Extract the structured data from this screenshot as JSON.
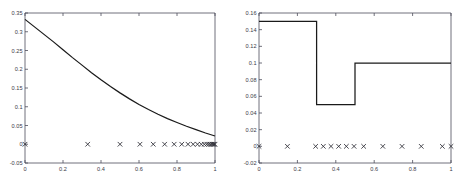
{
  "figure": {
    "background_color": "#ffffff",
    "axis_color": "#4d4d5a",
    "curve_color": "#1a1a1a",
    "marker_color": "#2b2b33",
    "panel_count": 2
  },
  "chart_data": [
    {
      "type": "line",
      "panel": "left",
      "title": "",
      "xlabel": "",
      "ylabel": "",
      "xlim": [
        0,
        1
      ],
      "ylim": [
        -0.05,
        0.35
      ],
      "grid": false,
      "legend": null,
      "xticks": [
        0,
        0.2,
        0.4,
        0.6,
        0.8,
        1
      ],
      "xtick_labels": [
        "0",
        "0.2",
        "0.4",
        "0.6",
        "0.8",
        "1"
      ],
      "yticks": [
        -0.05,
        0,
        0.05,
        0.1,
        0.15,
        0.2,
        0.25,
        0.3,
        0.35
      ],
      "ytick_labels": [
        "-0.05",
        "0",
        "0.05",
        "0.1",
        "0.15",
        "0.2",
        "0.25",
        "0.3",
        "0.35"
      ],
      "series": [
        {
          "name": "decaying-curve",
          "style": "solid-line",
          "x": [
            0,
            0.05,
            0.1,
            0.15,
            0.2,
            0.25,
            0.3,
            0.35,
            0.4,
            0.45,
            0.5,
            0.55,
            0.6,
            0.65,
            0.7,
            0.75,
            0.8,
            0.85,
            0.9,
            0.95,
            1
          ],
          "y": [
            0.333,
            0.313,
            0.293,
            0.273,
            0.252,
            0.231,
            0.211,
            0.191,
            0.172,
            0.154,
            0.137,
            0.121,
            0.106,
            0.0925,
            0.08,
            0.0685,
            0.058,
            0.048,
            0.039,
            0.03,
            0.022
          ]
        },
        {
          "name": "x-markers",
          "style": "x-marker",
          "y_value": 0,
          "x": [
            0.0,
            0.33,
            0.5,
            0.605,
            0.675,
            0.735,
            0.785,
            0.825,
            0.858,
            0.885,
            0.908,
            0.928,
            0.944,
            0.957,
            0.968,
            0.977,
            0.984,
            0.99,
            0.995,
            1.0
          ]
        }
      ]
    },
    {
      "type": "line",
      "panel": "right",
      "title": "",
      "xlabel": "",
      "ylabel": "",
      "xlim": [
        0,
        1
      ],
      "ylim": [
        -0.02,
        0.16
      ],
      "grid": false,
      "legend": null,
      "xticks": [
        0,
        0.2,
        0.4,
        0.6,
        0.8,
        1
      ],
      "xtick_labels": [
        "0",
        "0.2",
        "0.4",
        "0.6",
        "0.8",
        "1"
      ],
      "yticks": [
        -0.02,
        0,
        0.02,
        0.04,
        0.06,
        0.08,
        0.1,
        0.12,
        0.14,
        0.16
      ],
      "ytick_labels": [
        "-0.02",
        "0",
        "0.02",
        "0.04",
        "0.06",
        "0.08",
        "0.1",
        "0.12",
        "0.14",
        "0.16"
      ],
      "series": [
        {
          "name": "step-function",
          "style": "solid-step",
          "x": [
            0.0,
            0.3,
            0.3,
            0.5,
            0.5,
            1.0
          ],
          "y": [
            0.15,
            0.15,
            0.05,
            0.05,
            0.1,
            0.1
          ]
        },
        {
          "name": "x-markers",
          "style": "x-marker",
          "y_value": 0,
          "x": [
            0.0,
            0.148,
            0.295,
            0.335,
            0.375,
            0.415,
            0.455,
            0.495,
            0.545,
            0.645,
            0.745,
            0.845,
            0.955,
            1.0
          ]
        }
      ]
    }
  ]
}
